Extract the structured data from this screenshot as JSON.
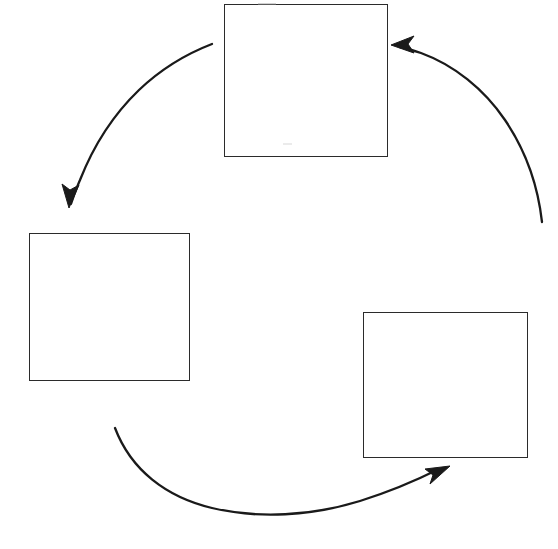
{
  "canvas": {
    "width": 558,
    "height": 549,
    "background_color": "#ffffff",
    "stroke_color": "#2b2b2b",
    "arrow_color": "#1a1a1a"
  },
  "diagram": {
    "type": "cycle",
    "title": "",
    "node_count": 3,
    "arrow_count": 3,
    "nodes": [
      {
        "id": "node-top",
        "label": "",
        "position": "top",
        "x": 224,
        "y": 4,
        "width": 164,
        "height": 153
      },
      {
        "id": "node-left",
        "label": "",
        "position": "left",
        "x": 29,
        "y": 233,
        "width": 161,
        "height": 148
      },
      {
        "id": "node-right",
        "label": "",
        "position": "bottom-right",
        "x": 363,
        "y": 312,
        "width": 165,
        "height": 146
      }
    ],
    "arrows": [
      {
        "id": "arrow-top-to-left",
        "from": "node-top",
        "to": "node-left",
        "label": "",
        "direction": "down-left",
        "path": "M 212 44 C 160 68 104 126 76 196",
        "tip_x": 69,
        "tip_y": 206,
        "tip_angle_deg": 112
      },
      {
        "id": "arrow-left-to-right",
        "from": "node-left",
        "to": "node-right",
        "label": "",
        "direction": "up-right",
        "path": "M 115 428 C 150 500 250 520 330 512 C 390 505 425 490 441 474",
        "tip_x": 449,
        "tip_y": 468,
        "tip_angle_deg": -38
      },
      {
        "id": "arrow-right-to-top",
        "from": "node-right",
        "to": "node-top",
        "label": "",
        "direction": "up-left",
        "path": "M 542 222 C 530 155 490 98 434 66 C 421 58 408 52 401 49",
        "tip_x": 393,
        "tip_y": 46,
        "tip_angle_deg": 200
      }
    ],
    "marks": [
      {
        "id": "top-edge-smudge",
        "x": 258,
        "y": 3,
        "width": 18,
        "height": 2
      },
      {
        "id": "interior-faint-mark",
        "x": 283,
        "y": 143,
        "width": 9,
        "height": 2
      }
    ]
  }
}
